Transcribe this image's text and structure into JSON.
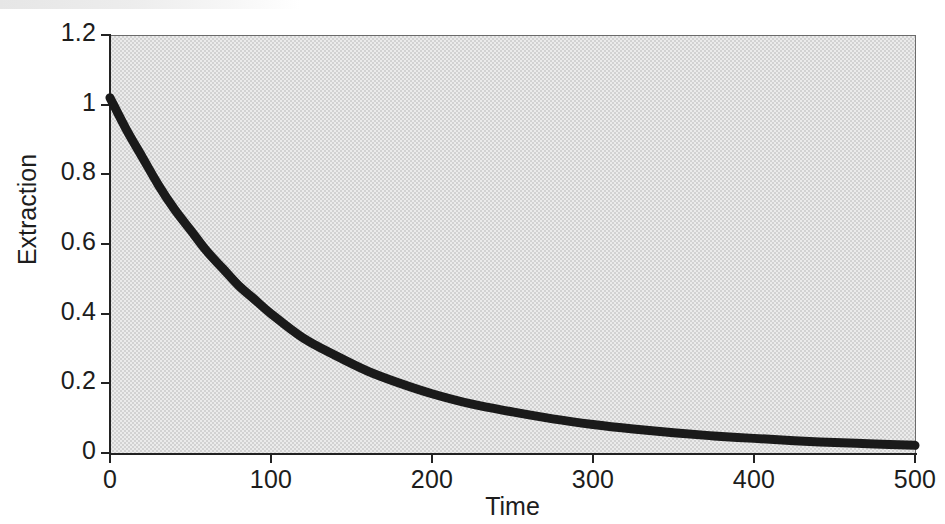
{
  "chart_data": {
    "type": "line",
    "title": "",
    "xlabel": "Time",
    "ylabel": "Extraction",
    "xlim": [
      0,
      500
    ],
    "ylim": [
      0,
      1.2
    ],
    "xticks": [
      "0",
      "100",
      "200",
      "300",
      "400",
      "500"
    ],
    "xtick_values": [
      0,
      100,
      200,
      300,
      400,
      500
    ],
    "yticks": [
      "0",
      "0.2",
      "0.4",
      "0.6",
      "0.8",
      "1",
      "1.2"
    ],
    "ytick_values": [
      0,
      0.2,
      0.4,
      0.6,
      0.8,
      1,
      1.2
    ],
    "grid": false,
    "legend": null,
    "series": [
      {
        "name": "Extraction",
        "color": "#1a1a1a",
        "line_width": 9,
        "x": [
          0,
          10,
          20,
          30,
          40,
          50,
          60,
          70,
          80,
          90,
          100,
          120,
          140,
          160,
          180,
          200,
          225,
          250,
          275,
          300,
          325,
          350,
          375,
          400,
          425,
          450,
          475,
          500
        ],
        "values": [
          1.02,
          0.93,
          0.85,
          0.77,
          0.7,
          0.64,
          0.58,
          0.53,
          0.48,
          0.44,
          0.4,
          0.33,
          0.28,
          0.235,
          0.2,
          0.17,
          0.14,
          0.118,
          0.098,
          0.082,
          0.069,
          0.058,
          0.049,
          0.042,
          0.035,
          0.03,
          0.026,
          0.022
        ]
      }
    ],
    "plot_background_color": "#d2d2d2",
    "figure_background_color": "#ffffff",
    "axis_color": "#222222"
  }
}
